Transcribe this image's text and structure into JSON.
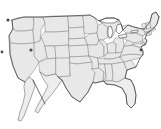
{
  "figure": {
    "title": "Map of the contiguous United States",
    "width": 161,
    "height": 129
  },
  "colors": {
    "background": "#fefefe",
    "state_fill": "#e8e8e8",
    "state_border": "#8a8a8a",
    "coastline": "#3d3d3d",
    "lake_fill": "#fdfdfd",
    "peninsula_fill": "#ededed",
    "marker": "#4a4a4a"
  },
  "map": {
    "projection_note": "equirectangular-like thumbnail",
    "regions": [
      {
        "name": "pacific-northwest",
        "label": "Pacific Northwest"
      },
      {
        "name": "mountain-west",
        "label": "Mountain West"
      },
      {
        "name": "great-plains",
        "label": "Great Plains"
      },
      {
        "name": "midwest",
        "label": "Midwest"
      },
      {
        "name": "northeast",
        "label": "Northeast"
      },
      {
        "name": "southeast",
        "label": "Southeast"
      },
      {
        "name": "southwest",
        "label": "Southwest"
      }
    ],
    "features": [
      {
        "name": "great-lakes",
        "label": "Great Lakes"
      },
      {
        "name": "florida-peninsula",
        "label": "Florida Peninsula"
      },
      {
        "name": "baja-california-peninsula",
        "label": "Baja California Peninsula"
      },
      {
        "name": "gulf-of-california",
        "label": "Gulf of California"
      },
      {
        "name": "cape-cod",
        "label": "Cape Cod"
      },
      {
        "name": "chesapeake-bay",
        "label": "Chesapeake Bay"
      },
      {
        "name": "gulf-coast",
        "label": "Gulf Coast"
      }
    ],
    "states": [
      {
        "code": "WA",
        "name": "Washington"
      },
      {
        "code": "OR",
        "name": "Oregon"
      },
      {
        "code": "CA",
        "name": "California"
      },
      {
        "code": "NV",
        "name": "Nevada"
      },
      {
        "code": "ID",
        "name": "Idaho"
      },
      {
        "code": "MT",
        "name": "Montana"
      },
      {
        "code": "WY",
        "name": "Wyoming"
      },
      {
        "code": "UT",
        "name": "Utah"
      },
      {
        "code": "AZ",
        "name": "Arizona"
      },
      {
        "code": "CO",
        "name": "Colorado"
      },
      {
        "code": "NM",
        "name": "New Mexico"
      },
      {
        "code": "ND",
        "name": "North Dakota"
      },
      {
        "code": "SD",
        "name": "South Dakota"
      },
      {
        "code": "NE",
        "name": "Nebraska"
      },
      {
        "code": "KS",
        "name": "Kansas"
      },
      {
        "code": "OK",
        "name": "Oklahoma"
      },
      {
        "code": "TX",
        "name": "Texas"
      },
      {
        "code": "MN",
        "name": "Minnesota"
      },
      {
        "code": "IA",
        "name": "Iowa"
      },
      {
        "code": "MO",
        "name": "Missouri"
      },
      {
        "code": "AR",
        "name": "Arkansas"
      },
      {
        "code": "LA",
        "name": "Louisiana"
      },
      {
        "code": "WI",
        "name": "Wisconsin"
      },
      {
        "code": "IL",
        "name": "Illinois"
      },
      {
        "code": "MI",
        "name": "Michigan"
      },
      {
        "code": "IN",
        "name": "Indiana"
      },
      {
        "code": "OH",
        "name": "Ohio"
      },
      {
        "code": "KY",
        "name": "Kentucky"
      },
      {
        "code": "TN",
        "name": "Tennessee"
      },
      {
        "code": "MS",
        "name": "Mississippi"
      },
      {
        "code": "AL",
        "name": "Alabama"
      },
      {
        "code": "GA",
        "name": "Georgia"
      },
      {
        "code": "FL",
        "name": "Florida"
      },
      {
        "code": "SC",
        "name": "South Carolina"
      },
      {
        "code": "NC",
        "name": "North Carolina"
      },
      {
        "code": "VA",
        "name": "Virginia"
      },
      {
        "code": "WV",
        "name": "West Virginia"
      },
      {
        "code": "MD",
        "name": "Maryland"
      },
      {
        "code": "DE",
        "name": "Delaware"
      },
      {
        "code": "PA",
        "name": "Pennsylvania"
      },
      {
        "code": "NJ",
        "name": "New Jersey"
      },
      {
        "code": "NY",
        "name": "New York"
      },
      {
        "code": "CT",
        "name": "Connecticut"
      },
      {
        "code": "RI",
        "name": "Rhode Island"
      },
      {
        "code": "MA",
        "name": "Massachusetts"
      },
      {
        "code": "VT",
        "name": "Vermont"
      },
      {
        "code": "NH",
        "name": "New Hampshire"
      },
      {
        "code": "ME",
        "name": "Maine"
      }
    ]
  }
}
